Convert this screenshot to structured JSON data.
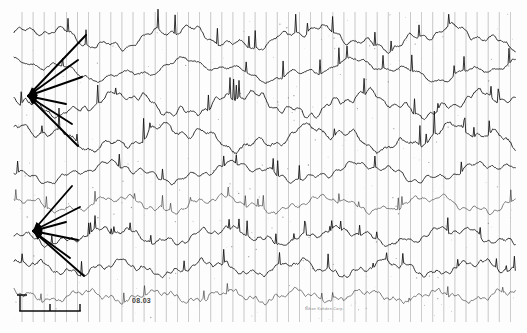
{
  "document": {
    "kind": "eeg-chart-recording",
    "title": "Analog EEG polygraph strip",
    "paper_color": "#fdfdfd",
    "ink_color": "#111111",
    "gridline_color": "#9a9a9a"
  },
  "annotations": {
    "stamp_text": "08.03",
    "imprint_text": "Nihon Kohden Corp.",
    "calibration": {
      "amplitude_label": "",
      "time_label": "",
      "bar_x": 20,
      "bar_y": 311,
      "bar_width": 60
    },
    "arrow_fans": [
      {
        "name": "upper-arrow-fan",
        "apex_x": 28,
        "apex_y": 96,
        "tips": [
          [
            86,
            35
          ],
          [
            78,
            60
          ],
          [
            82,
            77
          ],
          [
            66,
            104
          ],
          [
            72,
            124
          ],
          [
            78,
            146
          ]
        ]
      },
      {
        "name": "lower-arrow-fan",
        "apex_x": 33,
        "apex_y": 231,
        "tips": [
          [
            72,
            186
          ],
          [
            80,
            207
          ],
          [
            66,
            222
          ],
          [
            78,
            240
          ],
          [
            70,
            258
          ],
          [
            84,
            276
          ]
        ]
      }
    ]
  },
  "chart_data": {
    "type": "line",
    "subtitle": "Analog chart paper, vertical time gridlines",
    "xlabel": "",
    "ylabel": "",
    "grid": true,
    "legend_position": "none",
    "x_axis": {
      "unit": "time",
      "gridline_start_px": 22,
      "gridline_spacing_px": 11.1,
      "gridline_count": 45,
      "plot_left_px": 14,
      "plot_right_px": 516
    },
    "y_axis": {
      "unit": "microvolts",
      "ylim": [
        -1,
        1
      ]
    },
    "series": [
      {
        "name": "channel-1",
        "baseline_y": 38,
        "amplitude": 13,
        "freq": 0.46,
        "freq2": 1.45,
        "mix": 0.5,
        "noise": 0.32,
        "phase": 0.3,
        "style": "normal"
      },
      {
        "name": "channel-2",
        "baseline_y": 70,
        "amplitude": 12,
        "freq": 0.38,
        "freq2": 1.1,
        "mix": 0.55,
        "noise": 0.3,
        "phase": 1.1,
        "style": "normal"
      },
      {
        "name": "channel-3",
        "baseline_y": 104,
        "amplitude": 14,
        "freq": 0.52,
        "freq2": 1.7,
        "mix": 0.45,
        "noise": 0.35,
        "phase": 2.2,
        "style": "normal"
      },
      {
        "name": "channel-4",
        "baseline_y": 138,
        "amplitude": 15,
        "freq": 0.44,
        "freq2": 1.3,
        "mix": 0.6,
        "noise": 0.38,
        "phase": 0.8,
        "style": "normal"
      },
      {
        "name": "channel-5",
        "baseline_y": 172,
        "amplitude": 11,
        "freq": 0.5,
        "freq2": 1.55,
        "mix": 0.4,
        "noise": 0.3,
        "phase": 3.0,
        "style": "normal"
      },
      {
        "name": "channel-6",
        "baseline_y": 204,
        "amplitude": 9,
        "freq": 0.6,
        "freq2": 2.0,
        "mix": 0.45,
        "noise": 0.4,
        "phase": 1.7,
        "style": "faint"
      },
      {
        "name": "channel-7",
        "baseline_y": 236,
        "amplitude": 10,
        "freq": 0.55,
        "freq2": 1.85,
        "mix": 0.5,
        "noise": 0.42,
        "phase": 2.6,
        "style": "normal"
      },
      {
        "name": "channel-8",
        "baseline_y": 268,
        "amplitude": 9,
        "freq": 0.7,
        "freq2": 2.4,
        "mix": 0.5,
        "noise": 0.45,
        "phase": 0.5,
        "style": "normal"
      },
      {
        "name": "channel-9",
        "baseline_y": 296,
        "amplitude": 7,
        "freq": 0.9,
        "freq2": 3.1,
        "mix": 0.5,
        "noise": 0.55,
        "phase": 1.3,
        "style": "faint"
      }
    ]
  }
}
